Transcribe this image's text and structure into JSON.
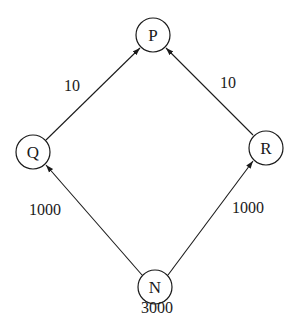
{
  "diagram": {
    "type": "directed-graph",
    "nodes": [
      {
        "id": "P",
        "label": "P",
        "cx": 153,
        "cy": 35
      },
      {
        "id": "Q",
        "label": "Q",
        "cx": 33,
        "cy": 152
      },
      {
        "id": "R",
        "label": "R",
        "cx": 266,
        "cy": 148
      },
      {
        "id": "N",
        "label": "N",
        "cx": 155,
        "cy": 287,
        "value": "3000"
      }
    ],
    "edges": [
      {
        "from": "Q",
        "to": "P",
        "label": "10"
      },
      {
        "from": "R",
        "to": "P",
        "label": "10"
      },
      {
        "from": "N",
        "to": "Q",
        "label": "1000"
      },
      {
        "from": "N",
        "to": "R",
        "label": "1000"
      }
    ],
    "labels": {
      "edge_qp": "10",
      "edge_rp": "10",
      "edge_nq": "1000",
      "edge_nr": "1000",
      "node_n_value": "3000"
    },
    "colors": {
      "stroke": "#1a1a1a",
      "background": "#ffffff"
    }
  }
}
